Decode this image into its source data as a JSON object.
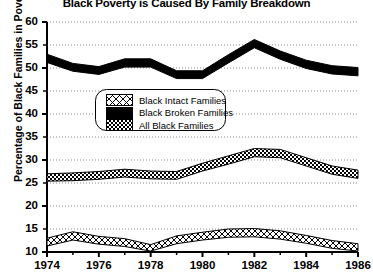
{
  "chart_data": {
    "type": "area",
    "title": "Black Poverty is Caused By Family Breakdown",
    "xlabel": "",
    "ylabel": "Percentage of Black Families in Poverty",
    "xlim": [
      1974,
      1986
    ],
    "ylim": [
      10,
      60
    ],
    "ytick_step": 5,
    "xtick_step": 2,
    "grid": true,
    "grid_style": "dotted-horizontal",
    "legend_position": "inside-upper-left",
    "x": [
      1974,
      1975,
      1976,
      1977,
      1978,
      1979,
      1980,
      1981,
      1982,
      1983,
      1984,
      1985,
      1986
    ],
    "yticks": [
      10,
      15,
      20,
      25,
      30,
      35,
      40,
      45,
      50,
      55,
      60
    ],
    "xticks": [
      1974,
      1976,
      1978,
      1980,
      1982,
      1984,
      1986
    ],
    "xtick_labels": [
      "1974",
      "1976",
      "1978",
      "1980",
      "1982",
      "1984",
      "1986"
    ],
    "ytick_labels": [
      "10",
      "15",
      "20",
      "25",
      "30",
      "35",
      "40",
      "45",
      "50",
      "55",
      "60"
    ],
    "series": [
      {
        "name": "Black Broken Families",
        "fill": "solid-black",
        "color": "#000000",
        "values": [
          53.0,
          51.0,
          50.3,
          52.0,
          52.0,
          49.4,
          49.4,
          52.9,
          56.2,
          53.7,
          51.7,
          50.5,
          50.1
        ],
        "band_lower": [
          51.2,
          49.3,
          48.6,
          50.2,
          50.2,
          47.7,
          47.7,
          51.1,
          54.4,
          51.9,
          49.9,
          48.7,
          48.3
        ]
      },
      {
        "name": "All Black Families",
        "fill": "checker-gray",
        "color": "#555555",
        "values": [
          27.0,
          27.2,
          27.5,
          28.0,
          27.6,
          27.5,
          29.3,
          30.9,
          32.5,
          32.3,
          30.5,
          28.7,
          27.8
        ],
        "band_lower": [
          25.4,
          25.5,
          25.8,
          26.3,
          25.9,
          25.8,
          27.6,
          29.1,
          30.7,
          30.5,
          28.7,
          26.9,
          26.0
        ]
      },
      {
        "name": "Black Intact Families",
        "fill": "cross-hatch-white",
        "color": "#ffffff",
        "values": [
          13.0,
          14.4,
          13.4,
          12.9,
          11.6,
          13.5,
          14.3,
          15.0,
          15.1,
          14.6,
          13.6,
          12.5,
          11.8
        ],
        "band_lower": [
          11.3,
          12.6,
          11.7,
          11.2,
          10.2,
          11.8,
          12.6,
          13.2,
          13.3,
          12.8,
          11.9,
          10.8,
          10.2
        ]
      }
    ]
  },
  "legend": {
    "items": [
      {
        "label": "Black Intact Families",
        "swatch": "cross-hatch-white"
      },
      {
        "label": "Black Broken Families",
        "swatch": "solid-black"
      },
      {
        "label": "All Black Families",
        "swatch": "checker-gray"
      }
    ]
  }
}
